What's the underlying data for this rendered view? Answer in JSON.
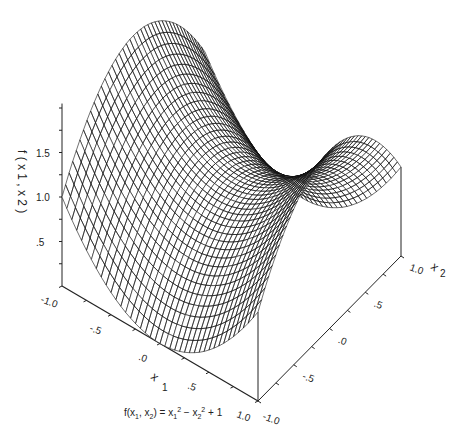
{
  "chart_data": {
    "type": "surface",
    "title": "",
    "function": "f(x1, x2) = x1^2 - x2^2 + 1",
    "caption": {
      "lhs": "f(x",
      "sub1": "1",
      "mid": ", x",
      "sub2": "2",
      "rhs": ") = x",
      "sub3": "1",
      "sup3": "2",
      "minus": " − x",
      "sub4": "2",
      "sup4": "2",
      "tail": " + 1"
    },
    "x1": {
      "label": "x",
      "label_sub": "1",
      "range": [
        -1.0,
        1.0
      ],
      "ticks": [
        -1.0,
        -0.5,
        0.0,
        0.5,
        1.0
      ],
      "tick_labels": [
        "-1.0",
        "-.5",
        ".0",
        ".5",
        "1.0"
      ]
    },
    "x2": {
      "label": "x",
      "label_sub": "2",
      "range": [
        -1.0,
        1.0
      ],
      "ticks": [
        -1.0,
        -0.5,
        0.0,
        0.5,
        1.0
      ],
      "tick_labels": [
        "-1.0",
        "-.5",
        ".0",
        ".5",
        "1.0"
      ]
    },
    "z": {
      "label": "f(x1, x2)",
      "label_text": "f ( x 1 , x 2 )",
      "range": [
        0,
        2.0
      ],
      "ticks": [
        0.5,
        1.0,
        1.5
      ],
      "tick_labels": [
        ".5",
        "1.0",
        "1.5"
      ]
    },
    "grid": {
      "n": 40
    },
    "surface_values_sample": {
      "x1": [
        -1,
        -0.5,
        0,
        0.5,
        1
      ],
      "x2": [
        -1,
        -0.5,
        0,
        0.5,
        1
      ],
      "z": [
        [
          1.0,
          1.75,
          2.0,
          1.75,
          1.0
        ],
        [
          0.25,
          1.0,
          1.25,
          1.0,
          0.25
        ],
        [
          0.0,
          0.75,
          1.0,
          0.75,
          0.0
        ],
        [
          0.25,
          1.0,
          1.25,
          1.0,
          0.25
        ],
        [
          1.0,
          1.75,
          2.0,
          1.75,
          1.0
        ]
      ]
    },
    "colors": {
      "mesh": "#111111",
      "axis": "#222222",
      "background": "#ffffff"
    }
  }
}
